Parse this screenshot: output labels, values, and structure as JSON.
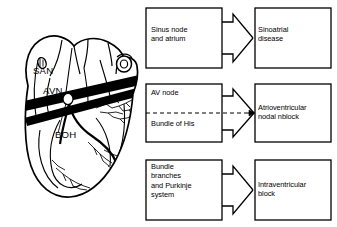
{
  "figure": {
    "background": "#ffffff",
    "line_color": "#000000"
  },
  "heart_diagram": {
    "name": "cardiac-conduction-system",
    "labels": [
      {
        "id": "san",
        "text": "SAN",
        "meaning": "sinoatrial node",
        "x": 34,
        "y": 72
      },
      {
        "id": "avn",
        "text": "AVN",
        "meaning": "atrioventricular node",
        "x": 44,
        "y": 92
      },
      {
        "id": "boh",
        "text": "BOH",
        "meaning": "bundle of His",
        "x": 56,
        "y": 136
      }
    ]
  },
  "flowchart": {
    "type": "three-row mapping diagram",
    "rows": [
      {
        "id": "row-sinus",
        "source": {
          "lines": "Sinus node\nand atrium",
          "split": false
        },
        "arrow": "block-arrow-right",
        "target": {
          "lines": "Sinoatrial\ndisease"
        }
      },
      {
        "id": "row-av",
        "source": {
          "lines_top": "AV node",
          "lines_bottom": "Bundle of His",
          "split": true,
          "divider": "dashed"
        },
        "arrow": "block-arrow-right-with-dashed-axis",
        "target": {
          "lines": "Atrioventricular\nnodal nblock"
        }
      },
      {
        "id": "row-bundle",
        "source": {
          "lines": "Bundle\nbranches\nand Purkinje\nsystem",
          "split": false
        },
        "arrow": "block-arrow-right",
        "target": {
          "lines": "Intraventricular\nblock"
        }
      }
    ]
  }
}
